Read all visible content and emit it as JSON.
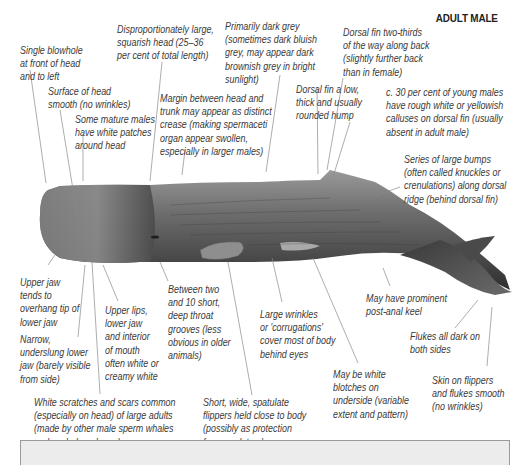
{
  "diagram": {
    "title": "ADULT MALE",
    "labels": {
      "blowhole": "Single blowhole\nat front of head\nand to left",
      "head_surface": "Surface of head\nsmooth (no wrinkles)",
      "white_patches": "Some mature males\nhave white patches\naround head",
      "large_head": "Disproportionately large,\nsquarish head (25–36\nper cent of total length)",
      "margin": "Margin between head and\ntrunk may appear as distinct\ncrease (making spermaceti\norgan appear swollen,\nespecially in larger males)",
      "colour": "Primarily dark grey\n(sometimes dark bluish\ngrey, may appear dark\nbrownish grey in bright\nsunlight)",
      "dorsal_hump": "Dorsal fin a low,\nthick and usually\nrounded hump",
      "dorsal_position": "Dorsal fin two-thirds\nof the way along back\n(slightly further back\nthan in female)",
      "calluses": "c. 30 per cent of young males\nhave rough white or yellowish\ncalluses on dorsal fin (usually\nabsent in adult male)",
      "knuckles": "Series of large bumps\n(often called knuckles or\ncrenulations) along dorsal\nridge (behind dorsal fin)",
      "upper_jaw": "Upper jaw\ntends to\noverhang tip of\nlower jaw",
      "lower_jaw": "Narrow,\nunderslung lower\njaw (barely visible\nfrom side)",
      "lips": "Upper lips,\nlower jaw\nand interior\nof mouth\noften white or\ncreamy white",
      "throat_grooves": "Between two\nand 10 short,\ndeep throat\ngrooves (less\nobvious in older\nanimals)",
      "wrinkles": "Large wrinkles\nor 'corrugations'\ncover most of body\nbehind eyes",
      "keel": "May have prominent\npost-anal keel",
      "flukes_dark": "Flukes all dark on\nboth sides",
      "scars": "White scratches and scars common\n(especially on head) of large adults\n(made by other male sperm whales\nand cephalopod prey)",
      "flippers": "Short, wide, spatulate\nflippers held close to body\n(possibly as protection\nfrom predators)",
      "blotches": "May be white\nblotches on\nunderside (variable\nextent and pattern)",
      "skin_smooth": "Skin on flippers\nand flukes smooth\n(no wrinkles)"
    },
    "colors": {
      "whale_body": "#5a5a5a",
      "whale_dark": "#2e2e2e",
      "leader_line": "#8a8a8a",
      "label_text": "#3a3a3a",
      "footer_box": "#ececec"
    }
  }
}
